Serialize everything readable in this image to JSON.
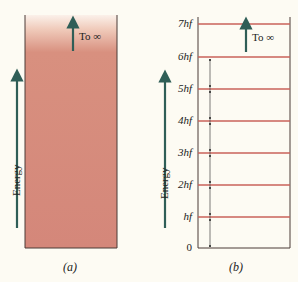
{
  "colors": {
    "background": "#fdfbf3",
    "continuum_fill": "#d4877a",
    "continuum_fade": "#f6e2d6",
    "level_line": "#c9625a",
    "arrow": "#2f5e57",
    "outline": "#4a3a36"
  },
  "panel_a": {
    "caption": "(a)",
    "arrow_label": "To ∞",
    "axis_label": "Energy",
    "description": "continuous energy band"
  },
  "panel_b": {
    "caption": "(b)",
    "arrow_label": "To ∞",
    "axis_label": "Energy",
    "levels": [
      {
        "label": "7hf",
        "y": 24
      },
      {
        "label": "6hf",
        "y": 57
      },
      {
        "label": "5hf",
        "y": 89
      },
      {
        "label": "4hf",
        "y": 121
      },
      {
        "label": "3hf",
        "y": 153
      },
      {
        "label": "2hf",
        "y": 185
      },
      {
        "label": "hf",
        "y": 217
      },
      {
        "label": "0",
        "y": 248
      }
    ]
  }
}
